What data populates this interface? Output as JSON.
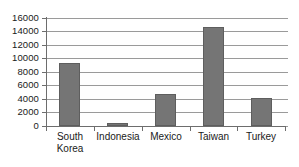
{
  "chart_data": {
    "type": "bar",
    "title": "",
    "subtitle": "",
    "xlabel": "",
    "ylabel": "",
    "categories": [
      "South Korea",
      "Indonesia",
      "Mexico",
      "Taiwan",
      "Turkey"
    ],
    "category_labels_display": [
      "South\nKorea",
      "Indonesia",
      "Mexico",
      "Taiwan",
      "Turkey"
    ],
    "values": [
      9300,
      450,
      4700,
      14600,
      4100
    ],
    "series": [
      {
        "name": "",
        "values": [
          9300,
          450,
          4700,
          14600,
          4100
        ]
      }
    ],
    "ylim": [
      0,
      16000
    ],
    "ytick_values": [
      0,
      2000,
      4000,
      6000,
      8000,
      10000,
      12000,
      14000,
      16000
    ],
    "ytick_labels": [
      "0",
      "2000",
      "4000",
      "6000",
      "8000",
      "10000",
      "12000",
      "14000",
      "16000"
    ],
    "grid": true,
    "grid_axis": "y",
    "legend": false,
    "legend_position": "none",
    "annotations": [],
    "colors": {
      "bar_fill": "#757575",
      "bar_stroke": "#5e5e5e",
      "gridline": "#9a9a9a",
      "axis": "#6d6d6d",
      "text": "#1a1a1a",
      "background": "#ffffff"
    }
  }
}
